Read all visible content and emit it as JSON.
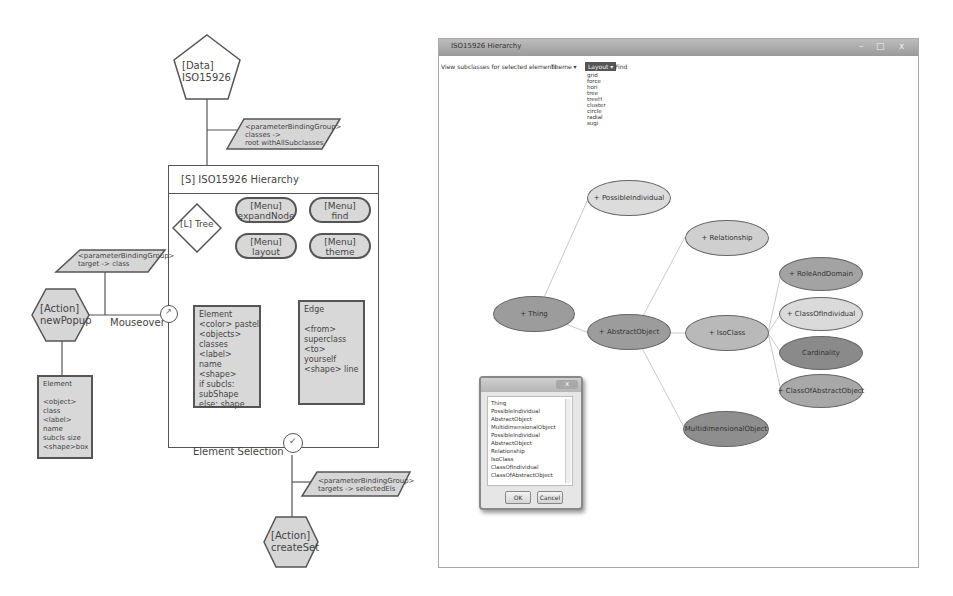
{
  "diagram": {
    "data_node": {
      "label": "[Data]\nISO15926"
    },
    "param_top": {
      "label": "<parameterBindingGroup>\nclasses ->\nroot withAllSubclasses"
    },
    "screen": {
      "title": "[S] ISO15926 Hierarchy",
      "layout_node": {
        "label": "[L] Tree"
      },
      "menus": [
        {
          "label": "[Menu]\nexpandNode"
        },
        {
          "label": "[Menu]\nfind"
        },
        {
          "label": "[Menu]\nlayout"
        },
        {
          "label": "[Menu]\ntheme"
        }
      ],
      "element_card": {
        "text": "Element\n<color> pastel\n<objects>\nclasses\n<label>\nname\n<shape>\nif subcls:\nsubShape\nelse: shape"
      },
      "edge_card": {
        "text": "Edge\n\n<from>\nsuperclass\n<to>\nyourself\n<shape> line"
      }
    },
    "param_left": {
      "label": "<parameterBindingGroup>\ntarget -> class"
    },
    "action_popup": {
      "label": "[Action]\nnewPopup"
    },
    "mouseover_label": "Mouseover",
    "popup_element_card": {
      "text": "Element\n\n<object>\nclass\n<label>\nname\nsubcls size\n<shape>box"
    },
    "selection_label": "Element Selection",
    "param_bottom": {
      "label": "<parameterBindingGroup>\ntargets -> selectedEls"
    },
    "action_create": {
      "label": "[Action]\ncreateSet"
    }
  },
  "app_window": {
    "title": "ISO15926 Hierarchy",
    "controls": {
      "minimize": "–",
      "maximize": "□",
      "close": "x"
    },
    "toolbar": {
      "hint": "View subclasses for selected elements",
      "theme_menu": "Theme ▾",
      "layout_menu": "Layout ▾",
      "find": "Find"
    },
    "layout_options": [
      "grid",
      "force",
      "hori",
      "tree",
      "treeH",
      "cluster",
      "circle",
      "radial",
      "sugi"
    ],
    "graph": {
      "nodes": [
        {
          "id": "thing",
          "label": "+ Thing",
          "shade": "#9c9c9c"
        },
        {
          "id": "possible",
          "label": "+ PossibleIndividual",
          "shade": "#dcdcdc"
        },
        {
          "id": "abstract",
          "label": "+ AbstractObject",
          "shade": "#9c9c9c"
        },
        {
          "id": "relationship",
          "label": "+ Relationship",
          "shade": "#cfcfcf"
        },
        {
          "id": "isoclass",
          "label": "+ IsoClass",
          "shade": "#b9b9b9"
        },
        {
          "id": "multi",
          "label": "MultidimensionalObject",
          "shade": "#8e8e8e"
        },
        {
          "id": "role",
          "label": "+ RoleAndDomain",
          "shade": "#a3a3a3"
        },
        {
          "id": "classind",
          "label": "+ ClassOfIndividual",
          "shade": "#dadada"
        },
        {
          "id": "cardinality",
          "label": "Cardinality",
          "shade": "#8a8a8a"
        },
        {
          "id": "classabs",
          "label": "+ ClassOfAbstractObject",
          "shade": "#a8a8a8"
        }
      ]
    },
    "dialog": {
      "title": "",
      "close": "x",
      "items": [
        "Thing",
        "PossibleIndividual",
        "AbstractObject",
        "MultidimensionalObject",
        "PossibleIndividual",
        "AbstractObject",
        "Relationship",
        "IsoClass",
        "ClassOfIndividual",
        "ClassOfAbstractObject"
      ],
      "ok": "OK",
      "cancel": "Cancel"
    }
  }
}
